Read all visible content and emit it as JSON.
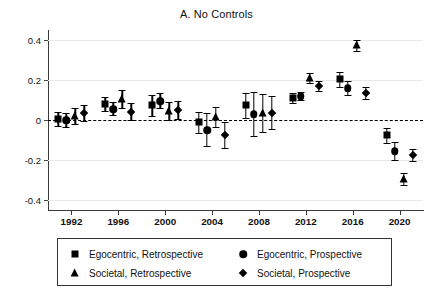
{
  "chart_data": {
    "type": "scatter",
    "title": "A. No Controls",
    "xlabel": "",
    "ylabel": "",
    "ylim": [
      -0.45,
      0.45
    ],
    "yticks": [
      0.4,
      0.2,
      0,
      -0.2,
      -0.4
    ],
    "ytick_labels": [
      "0.4",
      "0.2",
      "0",
      "-0.2",
      "-0.4"
    ],
    "categories": [
      "1992",
      "1996",
      "2000",
      "2004",
      "2008",
      "2012",
      "2016",
      "2020"
    ],
    "grid": "horizontal",
    "legend_position": "below",
    "zero_reference_line": 0,
    "series": [
      {
        "name": "Egocentric, Retrospective",
        "marker": "square",
        "values": [
          0.005,
          0.08,
          0.075,
          -0.01,
          0.075,
          0.11,
          0.205,
          -0.075
        ],
        "ci_low": [
          -0.03,
          0.045,
          0.02,
          -0.065,
          0.01,
          0.085,
          0.165,
          -0.115
        ],
        "ci_high": [
          0.04,
          0.115,
          0.125,
          0.04,
          0.135,
          0.135,
          0.24,
          -0.04
        ]
      },
      {
        "name": "Egocentric, Prospective",
        "marker": "circle",
        "values": [
          0.0,
          0.055,
          0.095,
          -0.05,
          0.03,
          0.12,
          0.16,
          -0.155
        ],
        "ci_low": [
          -0.035,
          0.025,
          0.06,
          -0.13,
          -0.08,
          0.1,
          0.125,
          -0.2
        ],
        "ci_high": [
          0.035,
          0.09,
          0.135,
          0.035,
          0.14,
          0.14,
          0.195,
          -0.11
        ]
      },
      {
        "name": "Societal, Retrospective",
        "marker": "triangle",
        "values": [
          0.02,
          0.105,
          0.045,
          0.015,
          0.035,
          0.21,
          0.375,
          -0.295
        ],
        "ci_low": [
          -0.02,
          0.06,
          0.0,
          -0.035,
          -0.06,
          0.185,
          0.345,
          -0.325
        ],
        "ci_high": [
          0.06,
          0.15,
          0.09,
          0.065,
          0.13,
          0.235,
          0.4,
          -0.265
        ]
      },
      {
        "name": "Societal, Prospective",
        "marker": "diamond",
        "values": [
          0.035,
          0.04,
          0.05,
          -0.075,
          0.035,
          0.17,
          0.135,
          -0.175
        ],
        "ci_low": [
          -0.005,
          0.0,
          0.005,
          -0.14,
          -0.045,
          0.145,
          0.105,
          -0.205
        ],
        "ci_high": [
          0.075,
          0.085,
          0.095,
          -0.01,
          0.12,
          0.195,
          0.165,
          -0.145
        ]
      }
    ]
  },
  "legend": {
    "entries": [
      {
        "label": "Egocentric, Retrospective",
        "marker": "square"
      },
      {
        "label": "Egocentric, Prospective",
        "marker": "circle"
      },
      {
        "label": "Societal, Retrospective",
        "marker": "triangle"
      },
      {
        "label": "Societal, Prospective",
        "marker": "diamond"
      }
    ]
  },
  "colors": {
    "marker": "#000000",
    "axis": "#3a3a3a",
    "grid": "#e9e9e9",
    "text": "#111111",
    "background": "#ffffff"
  }
}
